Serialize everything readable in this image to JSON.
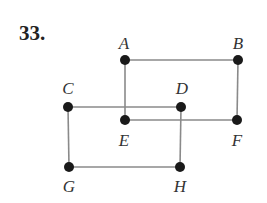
{
  "problem_number": "33.",
  "colors": {
    "edge": "#8a8a8a",
    "vertex": "#1a1a1a",
    "label": "#333333"
  },
  "vertices": [
    {
      "id": "A",
      "label": "A",
      "x": 125,
      "y": 60,
      "lx": 124,
      "ly": 49
    },
    {
      "id": "B",
      "label": "B",
      "x": 238,
      "y": 60,
      "lx": 238,
      "ly": 49
    },
    {
      "id": "C",
      "label": "C",
      "x": 68,
      "y": 107,
      "lx": 68,
      "ly": 94
    },
    {
      "id": "D",
      "label": "D",
      "x": 181,
      "y": 107,
      "lx": 182,
      "ly": 94
    },
    {
      "id": "E",
      "label": "E",
      "x": 125,
      "y": 120,
      "lx": 124,
      "ly": 146
    },
    {
      "id": "F",
      "label": "F",
      "x": 237,
      "y": 120,
      "lx": 237,
      "ly": 146
    },
    {
      "id": "G",
      "label": "G",
      "x": 69,
      "y": 167,
      "lx": 69,
      "ly": 192
    },
    {
      "id": "H",
      "label": "H",
      "x": 180,
      "y": 167,
      "lx": 180,
      "ly": 192
    }
  ],
  "edges": [
    [
      "A",
      "B"
    ],
    [
      "A",
      "E"
    ],
    [
      "B",
      "F"
    ],
    [
      "E",
      "F"
    ],
    [
      "C",
      "D"
    ],
    [
      "C",
      "G"
    ],
    [
      "D",
      "H"
    ],
    [
      "G",
      "H"
    ]
  ]
}
